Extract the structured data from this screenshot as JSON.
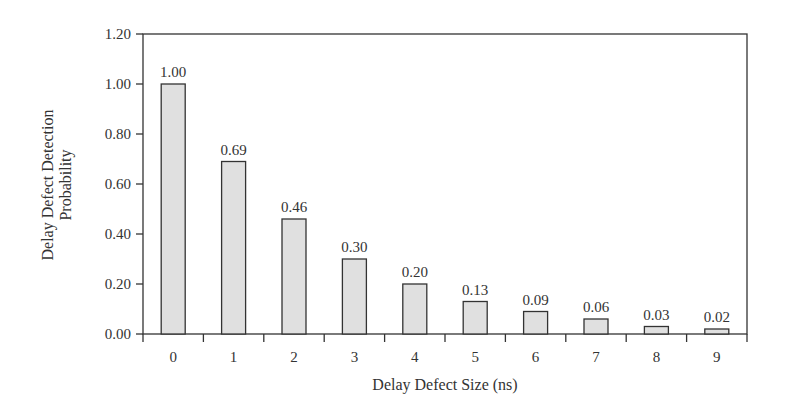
{
  "chart_data": {
    "type": "bar",
    "title": "",
    "xlabel": "Delay Defect Size (ns)",
    "ylabel": [
      "Delay Defect Detection",
      "Probability"
    ],
    "categories": [
      "0",
      "1",
      "2",
      "3",
      "4",
      "5",
      "6",
      "7",
      "8",
      "9"
    ],
    "values": [
      1.0,
      0.69,
      0.46,
      0.3,
      0.2,
      0.13,
      0.09,
      0.06,
      0.03,
      0.02
    ],
    "value_labels": [
      "1.00",
      "0.69",
      "0.46",
      "0.30",
      "0.20",
      "0.13",
      "0.09",
      "0.06",
      "0.03",
      "0.02"
    ],
    "ylim": [
      0,
      1.2
    ],
    "yticks": [
      0,
      0.2,
      0.4,
      0.6,
      0.8,
      1.0,
      1.2
    ],
    "ytick_labels": [
      "0.00",
      "0.20",
      "0.40",
      "0.60",
      "0.80",
      "1.00",
      "1.20"
    ],
    "grid": false,
    "legend": null,
    "colors": {
      "bar_fill": "#e0e0e0",
      "bar_stroke": "#333333",
      "axis": "#333333"
    }
  }
}
